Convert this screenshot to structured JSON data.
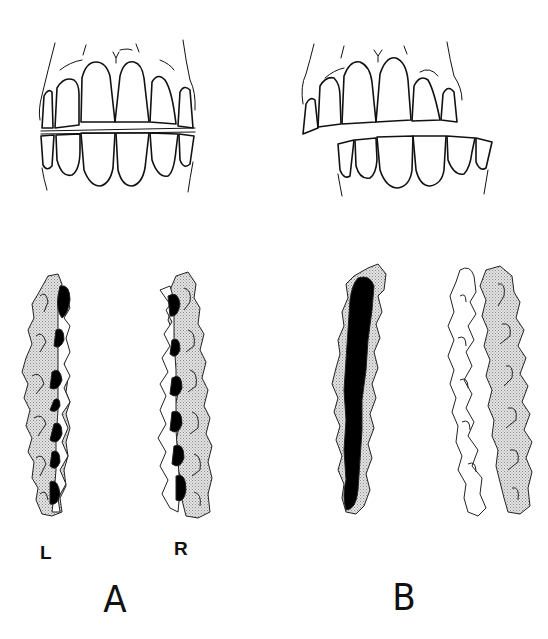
{
  "figure": {
    "panels": [
      {
        "id": "A",
        "label": "A",
        "front_view": "Teeth in normal occlusion, frontal view; upper and lower incisors aligned",
        "occlusal_views": [
          {
            "side_label": "L",
            "description": "Occlusal contact map, left side: dark contact spots along buccal edge"
          },
          {
            "side_label": "R",
            "description": "Occlusal contact map, right side: dark contact spots along lingual edge"
          }
        ]
      },
      {
        "id": "B",
        "label": "B",
        "front_view": "Teeth with lateral shift (crossbite), lower arch displaced to the right",
        "occlusal_views": [
          {
            "side_label": "",
            "description": "Occlusal contact map: continuous heavy dark contact along entire row"
          },
          {
            "side_label": "",
            "description": "Occlusal contact map: no dark contacts, arches separated"
          }
        ]
      }
    ],
    "legend": {
      "black_fill": "contact area",
      "stippled_fill": "tooth occlusal surface",
      "white_fill": "opposing tooth outline"
    },
    "colors": {
      "ink": "#111111",
      "stipple": "#c8c8c8",
      "background": "#ffffff"
    }
  }
}
